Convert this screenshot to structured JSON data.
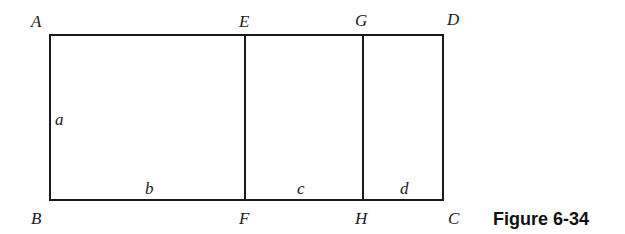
{
  "figure": {
    "caption": "Figure 6-34",
    "vertices": {
      "A": "A",
      "B": "B",
      "C": "C",
      "D": "D",
      "E": "E",
      "F": "F",
      "G": "G",
      "H": "H"
    },
    "segments": {
      "a": "a",
      "b": "b",
      "c": "c",
      "d": "d"
    },
    "colors": {
      "line": "#1a1a1a",
      "background": "#ffffff"
    }
  }
}
